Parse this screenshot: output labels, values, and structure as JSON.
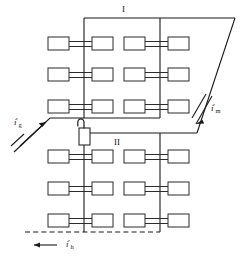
{
  "diagram": {
    "canvas": {
      "width": 249,
      "height": 258
    },
    "colors": {
      "line": "#1a1a1a",
      "unit_fill": "#ffffff",
      "unit_stroke": "#2b2b2b",
      "background": "#ffffff"
    },
    "labels": {
      "zone_one": "I",
      "zone_two": "II",
      "flow_supply_left": {
        "symbol": "i",
        "prime": "′",
        "subscript": "g"
      },
      "flow_return_right": {
        "symbol": "i",
        "prime": "′",
        "subscript": "m"
      },
      "flow_bottom": {
        "symbol": "i",
        "prime": "′",
        "subscript": "h"
      }
    },
    "risers": [
      {
        "name": "riser-left",
        "x": 84
      },
      {
        "name": "riser-right",
        "x": 160
      }
    ],
    "units": [
      {
        "row": 1,
        "column": "left",
        "cx": 84,
        "cy": 44
      },
      {
        "row": 1,
        "column": "right",
        "cx": 160,
        "cy": 44
      },
      {
        "row": 2,
        "column": "left",
        "cx": 84,
        "cy": 75
      },
      {
        "row": 2,
        "column": "right",
        "cx": 160,
        "cy": 75
      },
      {
        "row": 3,
        "column": "left",
        "cx": 84,
        "cy": 107
      },
      {
        "row": 3,
        "column": "right",
        "cx": 160,
        "cy": 107
      },
      {
        "row": 4,
        "column": "left",
        "cx": 84,
        "cy": 157
      },
      {
        "row": 4,
        "column": "right",
        "cx": 160,
        "cy": 157
      },
      {
        "row": 5,
        "column": "left",
        "cx": 84,
        "cy": 189
      },
      {
        "row": 5,
        "column": "right",
        "cx": 160,
        "cy": 189
      },
      {
        "row": 6,
        "column": "left",
        "cx": 84,
        "cy": 221
      },
      {
        "row": 6,
        "column": "right",
        "cx": 160,
        "cy": 221
      }
    ],
    "valve": {
      "name": "control-valve",
      "x": 79,
      "y": 128,
      "width": 11,
      "height": 17
    },
    "pipes": {
      "header_top_y": 18,
      "supply_mid_y": 118,
      "return_mid_y": 133,
      "dashed_bottom_y": 232,
      "dashed_left_x": 25,
      "slant_top_x": 235,
      "slant_bottom_x": 197
    }
  }
}
